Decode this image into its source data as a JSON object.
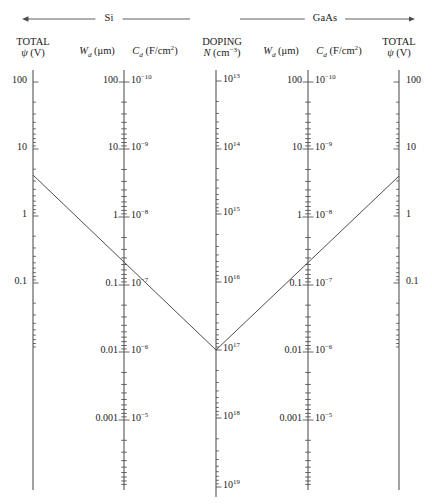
{
  "figure": {
    "type": "nomograph"
  },
  "bands": [
    {
      "name": "si-band",
      "label": "Si",
      "arrow": "left",
      "x_start": 28,
      "x_end": 190,
      "y": 19
    },
    {
      "name": "gaas-band",
      "label": "GaAs",
      "arrow": "right",
      "x_start": 240,
      "x_end": 410,
      "y": 19
    }
  ],
  "axes": [
    {
      "id": "si-total-psi",
      "x": 33,
      "top": 70,
      "bottom": 490,
      "tick_side": "right",
      "label_side": "left",
      "heading_line1": "TOTAL",
      "heading_line2": "ψ (V)",
      "heading_html": "TOTAL<span class=\"l2\"><i>ψ</i> (V)</span>",
      "decade_px": 67.0,
      "major": [
        {
          "value": "100",
          "y": 82,
          "html": "100"
        },
        {
          "value": "10",
          "y": 149,
          "html": "10"
        },
        {
          "value": "1",
          "y": 216,
          "html": "1"
        },
        {
          "value": "0.1",
          "y": 283,
          "html": "0.1"
        }
      ],
      "tick_range": {
        "top_decade_y": 82,
        "bottom_decade_y": 283
      }
    },
    {
      "id": "si-wd-cd",
      "x": 124,
      "top": 70,
      "bottom": 490,
      "tick_side": "both",
      "heading_left_html": "<i>W<sub>d</sub></i> (μm)",
      "heading_right_html": "<i>C<sub>d</sub></i> (F/cm<sup>2</sup>)",
      "decade_px": 67.5,
      "major_left": [
        {
          "value": "100",
          "y": 82,
          "html": "100"
        },
        {
          "value": "10",
          "y": 149,
          "html": "10"
        },
        {
          "value": "1",
          "y": 217,
          "html": "1"
        },
        {
          "value": "0.1",
          "y": 285,
          "html": "0.1"
        },
        {
          "value": "0.01",
          "y": 352,
          "html": "0.01"
        },
        {
          "value": "0.001",
          "y": 420,
          "html": "0.001"
        }
      ],
      "major_right": [
        {
          "value": "1e-10",
          "y": 82,
          "html": "10<sup>−10</sup>"
        },
        {
          "value": "1e-9",
          "y": 149,
          "html": "10<sup>−9</sup>"
        },
        {
          "value": "1e-8",
          "y": 217,
          "html": "10<sup>−8</sup>"
        },
        {
          "value": "1e-7",
          "y": 285,
          "html": "10<sup>−7</sup>"
        },
        {
          "value": "1e-6",
          "y": 352,
          "html": "10<sup>−6</sup>"
        },
        {
          "value": "1e-5",
          "y": 420,
          "html": "10<sup>−5</sup>"
        }
      ]
    },
    {
      "id": "doping-n",
      "x": 216,
      "top": 70,
      "bottom": 497,
      "tick_side": "right",
      "heading_line1": "DOPING",
      "heading_line2": "N (cm−3)",
      "heading_html": "DOPING<span class=\"l2\"><i>N</i> (cm<sup>−3</sup>)</span>",
      "decade_px": 67.8,
      "major": [
        {
          "value": "1e13",
          "y": 81,
          "html": "10<sup>13</sup>"
        },
        {
          "value": "1e14",
          "y": 149,
          "html": "10<sup>14</sup>"
        },
        {
          "value": "1e15",
          "y": 214,
          "html": "10<sup>15</sup>"
        },
        {
          "value": "1e16",
          "y": 282,
          "html": "10<sup>16</sup>"
        },
        {
          "value": "1e17",
          "y": 350,
          "html": "10<sup>17</sup>"
        },
        {
          "value": "1e18",
          "y": 418,
          "html": "10<sup>18</sup>"
        },
        {
          "value": "1e19",
          "y": 487,
          "html": "10<sup>19</sup>"
        }
      ]
    },
    {
      "id": "gaas-wd-cd",
      "x": 308,
      "top": 70,
      "bottom": 490,
      "tick_side": "both",
      "heading_left_html": "<i>W<sub>d</sub></i> (μm)",
      "heading_right_html": "<i>C<sub>d</sub></i> (F/cm<sup>2</sup>)",
      "decade_px": 67.5,
      "major_left": [
        {
          "value": "100",
          "y": 82,
          "html": "100"
        },
        {
          "value": "10",
          "y": 149,
          "html": "10"
        },
        {
          "value": "1",
          "y": 217,
          "html": "1"
        },
        {
          "value": "0.1",
          "y": 285,
          "html": "0.1"
        },
        {
          "value": "0.01",
          "y": 352,
          "html": "0.01"
        },
        {
          "value": "0.001",
          "y": 420,
          "html": "0.001"
        }
      ],
      "major_right": [
        {
          "value": "1e-10",
          "y": 82,
          "html": "10<sup>−10</sup>"
        },
        {
          "value": "1e-9",
          "y": 149,
          "html": "10<sup>−9</sup>"
        },
        {
          "value": "1e-8",
          "y": 217,
          "html": "10<sup>−8</sup>"
        },
        {
          "value": "1e-7",
          "y": 285,
          "html": "10<sup>−7</sup>"
        },
        {
          "value": "1e-6",
          "y": 352,
          "html": "10<sup>−6</sup>"
        },
        {
          "value": "1e-5",
          "y": 420,
          "html": "10<sup>−5</sup>"
        }
      ]
    },
    {
      "id": "gaas-total-psi",
      "x": 399,
      "top": 70,
      "bottom": 490,
      "tick_side": "left",
      "label_side": "right",
      "heading_line1": "TOTAL",
      "heading_line2": "ψ (V)",
      "heading_html": "TOTAL<span class=\"l2\"><i>ψ</i> (V)</span>",
      "decade_px": 67.0,
      "major": [
        {
          "value": "100",
          "y": 82,
          "html": "100"
        },
        {
          "value": "10",
          "y": 149,
          "html": "10"
        },
        {
          "value": "1",
          "y": 216,
          "html": "1"
        },
        {
          "value": "0.1",
          "y": 283,
          "html": "0.1"
        }
      ],
      "tick_range": {
        "top_decade_y": 82,
        "bottom_decade_y": 283
      }
    }
  ],
  "construction_line": {
    "name": "isopleth",
    "vertex": {
      "x": 216,
      "y": 350,
      "doping": "1e17"
    },
    "left_end": {
      "x": 33,
      "y": 175
    },
    "right_end": {
      "x": 399,
      "y": 176
    },
    "color": "#3a3a3a",
    "width": 0.9
  },
  "chart_data": {
    "type": "line",
    "title": "",
    "xlabel": "",
    "ylabel": "",
    "grid": false,
    "legend": "none",
    "series": [
      {
        "name": "isopleth-left-branch",
        "x": [
          33,
          216
        ],
        "y": [
          175,
          350
        ]
      },
      {
        "name": "isopleth-right-branch",
        "x": [
          216,
          399
        ],
        "y": [
          350,
          176
        ]
      }
    ],
    "scales": [
      {
        "name": "Si TOTAL psi (V)",
        "ticks": [
          100,
          10,
          1,
          0.1
        ]
      },
      {
        "name": "Si Wd (um)",
        "ticks": [
          100,
          10,
          1,
          0.1,
          0.01,
          0.001
        ]
      },
      {
        "name": "Si Cd (F/cm2)",
        "ticks": [
          "1e-10",
          "1e-9",
          "1e-8",
          "1e-7",
          "1e-6",
          "1e-5"
        ]
      },
      {
        "name": "DOPING N (cm-3)",
        "ticks": [
          "1e13",
          "1e14",
          "1e15",
          "1e16",
          "1e17",
          "1e18",
          "1e19"
        ]
      },
      {
        "name": "GaAs Wd (um)",
        "ticks": [
          100,
          10,
          1,
          0.1,
          0.01,
          0.001
        ]
      },
      {
        "name": "GaAs Cd (F/cm2)",
        "ticks": [
          "1e-10",
          "1e-9",
          "1e-8",
          "1e-7",
          "1e-6",
          "1e-5"
        ]
      },
      {
        "name": "GaAs TOTAL psi (V)",
        "ticks": [
          100,
          10,
          1,
          0.1
        ]
      }
    ]
  }
}
